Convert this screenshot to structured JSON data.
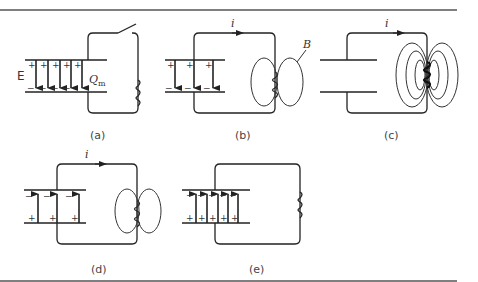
{
  "figure": {
    "panels": [
      {
        "id": "a",
        "caption": "(a)",
        "field_label": "E",
        "charge_label": "Q",
        "charge_subscript": "m",
        "switch": "open",
        "capacitor_field": "down-full"
      },
      {
        "id": "b",
        "caption": "(b)",
        "current_label": "i",
        "magnetic_label": "B",
        "capacitor_field": "down-partial"
      },
      {
        "id": "c",
        "caption": "(c)",
        "current_label": "i",
        "capacitor_field": "none",
        "magnetic_field": "full"
      },
      {
        "id": "d",
        "caption": "(d)",
        "current_label": "i",
        "capacitor_field": "up-partial"
      },
      {
        "id": "e",
        "caption": "(e)",
        "capacitor_field": "up-full"
      }
    ],
    "symbols": {
      "plus": "+",
      "minus": "−"
    }
  }
}
